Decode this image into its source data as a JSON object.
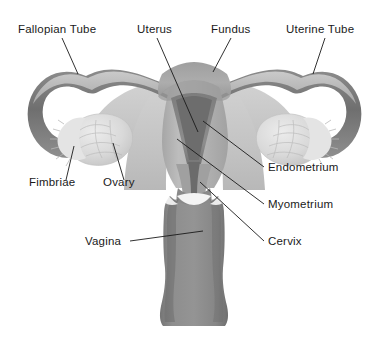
{
  "figure": {
    "background_color": "#ffffff",
    "width": 389,
    "height": 340,
    "label_color": "#1a1a1a",
    "leader_color": "#1a1a1a"
  },
  "palette": {
    "tube_outer": "#7b7b7b",
    "tube_inner": "#9a9a9a",
    "tube_highlight": "#c9c9c9",
    "broad_ligament": "#c6c6c6",
    "myometrium": "#b4b4b4",
    "fundus": "#a8a8a8",
    "endometrium": "#8a8a8a",
    "cavity": "#6f6f6f",
    "cervix": "#7e7e7e",
    "vagina": "#8b8b8b",
    "vagina_shadow": "#777777",
    "ovary": "#d8d8d8",
    "fimbriae": "#e2e2e2",
    "outline": "#6a6a6a"
  },
  "labels": [
    {
      "id": "fallopian-tube",
      "text": "Fallopian Tube",
      "x": 18,
      "y": 33,
      "anchor": "start"
    },
    {
      "id": "uterus",
      "text": "Uterus",
      "x": 137,
      "y": 33,
      "anchor": "start"
    },
    {
      "id": "fundus",
      "text": "Fundus",
      "x": 211,
      "y": 33,
      "anchor": "start"
    },
    {
      "id": "uterine-tube",
      "text": "Uterine Tube",
      "x": 286,
      "y": 33,
      "anchor": "start"
    },
    {
      "id": "fimbriae",
      "text": "Fimbriae",
      "x": 29,
      "y": 186,
      "anchor": "start"
    },
    {
      "id": "ovary",
      "text": "Ovary",
      "x": 103,
      "y": 186,
      "anchor": "start"
    },
    {
      "id": "endometrium",
      "text": "Endometrium",
      "x": 268,
      "y": 171,
      "anchor": "start"
    },
    {
      "id": "myometrium",
      "text": "Myometrium",
      "x": 268,
      "y": 208,
      "anchor": "start"
    },
    {
      "id": "cervix",
      "text": "Cervix",
      "x": 268,
      "y": 245,
      "anchor": "start"
    },
    {
      "id": "vagina",
      "text": "Vagina",
      "x": 85,
      "y": 245,
      "anchor": "start"
    }
  ],
  "leaders": [
    {
      "id": "leader-fallopian-tube",
      "d": "M 62,38 L 78,74"
    },
    {
      "id": "leader-uterus",
      "d": "M 157,38 L 198,132"
    },
    {
      "id": "leader-fundus",
      "d": "M 231,38 L 213,72"
    },
    {
      "id": "leader-uterine-tube",
      "d": "M 325,38 L 313,74"
    },
    {
      "id": "leader-fimbriae",
      "d": "M 66,180 L 74,146"
    },
    {
      "id": "leader-ovary",
      "d": "M 124,180 L 113,143"
    },
    {
      "id": "leader-endometrium",
      "d": "M 264,167 L 203,121"
    },
    {
      "id": "leader-myometrium",
      "d": "M 264,204 L 177,139"
    },
    {
      "id": "leader-cervix",
      "d": "M 264,241 L 200,182"
    },
    {
      "id": "leader-vagina",
      "d": "M 130,241 L 203,231"
    }
  ],
  "structures": [
    {
      "id": "left-fallopian-tube",
      "name": "fallopian-tube-left"
    },
    {
      "id": "right-fallopian-tube",
      "name": "fallopian-tube-right"
    },
    {
      "id": "left-ovary",
      "name": "ovary-left"
    },
    {
      "id": "right-ovary",
      "name": "ovary-right"
    },
    {
      "id": "left-fimbriae",
      "name": "fimbriae-left"
    },
    {
      "id": "right-fimbriae",
      "name": "fimbriae-right"
    },
    {
      "id": "broad-ligament",
      "name": "broad-ligament"
    },
    {
      "id": "uterus-body",
      "name": "uterus-body"
    },
    {
      "id": "fundus-dome",
      "name": "fundus"
    },
    {
      "id": "endometrium-cavity",
      "name": "endometrium"
    },
    {
      "id": "cervix-canal",
      "name": "cervix"
    },
    {
      "id": "vagina-canal",
      "name": "vagina"
    }
  ]
}
